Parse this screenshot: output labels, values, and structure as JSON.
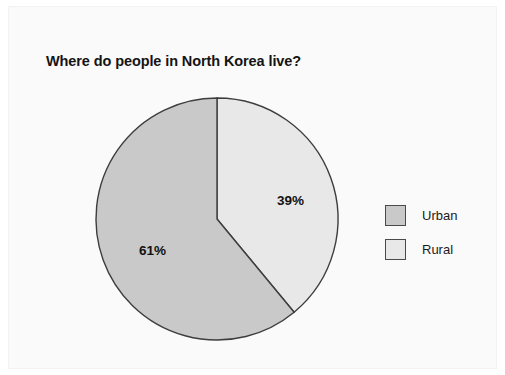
{
  "chart_data": {
    "type": "pie",
    "title": "Where do people in North Korea live?",
    "categories": [
      "Urban",
      "Rural"
    ],
    "values": [
      61,
      39
    ],
    "labels": [
      "61%",
      "39%"
    ],
    "unit": "%",
    "legend_position": "right",
    "grid": false,
    "xlabel": "",
    "ylabel": "",
    "slices": [
      {
        "name": "Urban",
        "value": 61,
        "label": "61%",
        "color": "#c9c9c9",
        "start_pct": 39,
        "end_pct": 100
      },
      {
        "name": "Rural",
        "value": 39,
        "label": "39%",
        "color": "#e8e8e8",
        "start_pct": 0,
        "end_pct": 39
      }
    ]
  },
  "legend": {
    "items": [
      {
        "label": "Urban",
        "color": "#c9c9c9"
      },
      {
        "label": "Rural",
        "color": "#e8e8e8"
      }
    ]
  },
  "colors": {
    "urban": "#c9c9c9",
    "rural": "#e8e8e8",
    "outline": "#3d3d3d",
    "panel_background": "#fafafa",
    "page_background": "#ffffff",
    "text": "#141414"
  }
}
